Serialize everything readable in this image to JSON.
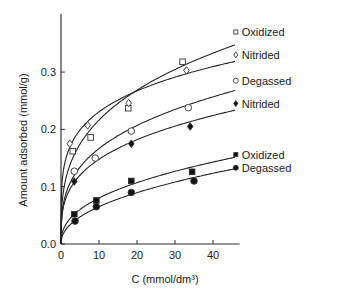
{
  "chart_data": {
    "type": "scatter",
    "title": "",
    "xlabel": "C (mmol/dm³)",
    "ylabel": "Amount adsorbed (mmol/g)",
    "xlim": [
      0,
      47
    ],
    "ylim": [
      0,
      0.37
    ],
    "xticks": [
      0,
      10,
      20,
      30,
      40
    ],
    "yticks": [
      0.0,
      0.1,
      0.2,
      0.3
    ],
    "xtick_labels": [
      "0",
      "10",
      "20",
      "30",
      "40"
    ],
    "ytick_labels": [
      "0.0",
      "0.1",
      "0.2",
      "0.3"
    ],
    "grid": false,
    "legend_position": "inline-right",
    "series": [
      {
        "name": "Oxidized",
        "marker": "open-square",
        "x": [
          3.1,
          7.8,
          17.7,
          32.0
        ],
        "y": [
          0.162,
          0.186,
          0.237,
          0.318
        ],
        "fit_end": [
          46,
          0.37
        ],
        "label_y": 0.37
      },
      {
        "name": "Nitrided",
        "marker": "open-diamond",
        "x": [
          2.3,
          7.0,
          17.8,
          33.0
        ],
        "y": [
          0.175,
          0.207,
          0.246,
          0.303
        ],
        "fit_end": [
          46,
          0.33
        ],
        "label_y": 0.33
      },
      {
        "name": "Degassed",
        "marker": "open-circle",
        "x": [
          3.5,
          9.0,
          18.5,
          33.5
        ],
        "y": [
          0.127,
          0.15,
          0.197,
          0.238
        ],
        "fit_end": [
          46,
          0.285
        ],
        "label_y": 0.285
      },
      {
        "name": "Nitrided",
        "marker": "filled-diamond",
        "x": [
          3.5,
          18.5,
          34.0
        ],
        "y": [
          0.109,
          0.175,
          0.205
        ],
        "fit_end": [
          46,
          0.245
        ],
        "label_y": 0.245
      },
      {
        "name": "Oxidized",
        "marker": "filled-square",
        "x": [
          3.5,
          9.3,
          18.5,
          34.5
        ],
        "y": [
          0.052,
          0.076,
          0.11,
          0.126
        ],
        "fit_end": [
          46,
          0.156
        ],
        "label_y": 0.156
      },
      {
        "name": "Degassed",
        "marker": "filled-circle",
        "x": [
          3.7,
          9.3,
          18.5,
          35.0
        ],
        "y": [
          0.04,
          0.065,
          0.09,
          0.11
        ],
        "fit_end": [
          46,
          0.133
        ],
        "label_y": 0.133
      }
    ]
  }
}
